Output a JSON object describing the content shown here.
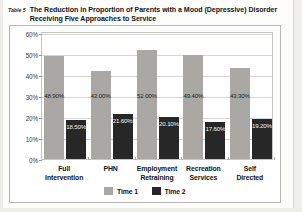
{
  "table_label": "Table 5",
  "title": "The Reduction in Proportion of Parents with a Mood (Depressive) Disorder Receiving Five Approaches to Service",
  "legend": {
    "items": [
      {
        "label": "Time 1",
        "color": "#a9a8a5"
      },
      {
        "label": "Time 2",
        "color": "#272727"
      }
    ]
  },
  "chart_data": {
    "type": "bar",
    "title": "The Reduction in Proportion of Parents with a Mood (Depressive) Disorder Receiving Five Approaches to Service",
    "xlabel": "",
    "ylabel": "",
    "ylim": [
      0,
      60
    ],
    "ytick_labels": [
      "0%",
      "10%",
      "20%",
      "30%",
      "40%",
      "50%",
      "60%"
    ],
    "ytick_values": [
      0,
      10,
      20,
      30,
      40,
      50,
      60
    ],
    "grid": true,
    "legend_position": "bottom",
    "categories": [
      "Full\nIntervention",
      "PHN",
      "Employment\nRetraining",
      "Recreation\nServices",
      "Self\nDirected"
    ],
    "series": [
      {
        "name": "Time 1",
        "color": "#a9a8a5",
        "values": [
          48.9,
          42.0,
          52.0,
          49.4,
          43.3
        ],
        "labels": [
          "48.90%",
          "42.00%",
          "52.00%",
          "49.40%",
          "43.30%"
        ]
      },
      {
        "name": "Time 2",
        "color": "#272727",
        "values": [
          18.5,
          21.6,
          20.1,
          17.6,
          19.2
        ],
        "labels": [
          "18.50%",
          "21.60%",
          "20.10%",
          "17.60%",
          "19.20%"
        ]
      }
    ]
  }
}
